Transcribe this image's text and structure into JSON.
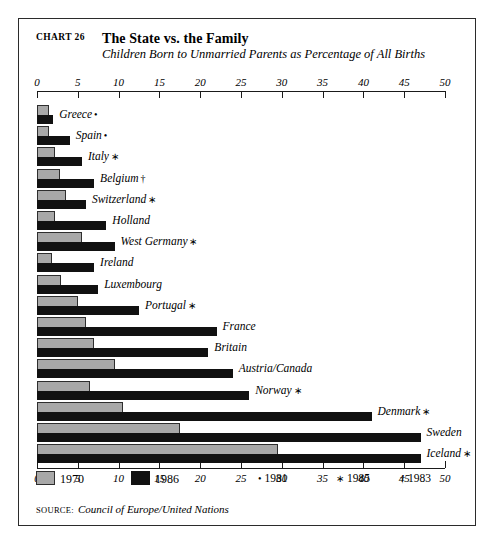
{
  "header": {
    "chart_number": "CHART 26",
    "title": "The State vs. the Family",
    "subtitle": "Children Born to Unmarried Parents as Percentage of All Births"
  },
  "legend": {
    "series": [
      {
        "label": "1970",
        "swatch": "gray-swatch",
        "color": "#a8a8a8"
      },
      {
        "label": "1986",
        "swatch": "black-swatch",
        "color": "#111111"
      }
    ],
    "notes": [
      {
        "symbol": "•",
        "label": "1981"
      },
      {
        "symbol": "∗",
        "label": "1985"
      },
      {
        "symbol": "†",
        "label": "1983"
      }
    ]
  },
  "source": {
    "label": "Source:",
    "text": "Council of Europe/United Nations"
  },
  "chart_data": {
    "type": "bar",
    "orientation": "horizontal",
    "title": "The State vs. the Family",
    "subtitle": "Children Born to Unmarried Parents as Percentage of All Births",
    "xlabel": "",
    "ylabel": "",
    "xlim": [
      0,
      50
    ],
    "xticks": [
      0,
      5,
      10,
      15,
      20,
      25,
      30,
      35,
      40,
      45,
      50
    ],
    "grid": false,
    "legend_position": "bottom-left",
    "categories": [
      "Greece",
      "Spain",
      "Italy",
      "Belgium",
      "Switzerland",
      "Holland",
      "West Germany",
      "Ireland",
      "Luxembourg",
      "Portugal",
      "France",
      "Britain",
      "Austria/Canada",
      "Norway",
      "Denmark",
      "Sweden",
      "Iceland"
    ],
    "category_marks": [
      "•",
      "•",
      "∗",
      "†",
      "∗",
      "",
      "∗",
      "",
      "",
      "∗",
      "",
      "",
      "",
      "∗",
      "∗",
      "",
      "∗"
    ],
    "series": [
      {
        "name": "1970",
        "color": "#a8a8a8",
        "values": [
          1.5,
          1.5,
          2.2,
          2.8,
          3.5,
          2.2,
          5.5,
          1.8,
          3.0,
          5.0,
          6.0,
          7.0,
          9.5,
          6.5,
          10.5,
          17.5,
          29.5
        ]
      },
      {
        "name": "1986",
        "color": "#111111",
        "values": [
          2.0,
          4.0,
          5.5,
          7.0,
          6.0,
          8.5,
          9.5,
          7.0,
          7.5,
          12.5,
          22.0,
          21.0,
          24.0,
          26.0,
          41.0,
          47.0,
          47.0
        ]
      }
    ]
  }
}
